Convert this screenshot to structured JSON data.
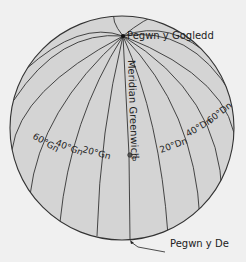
{
  "diagram": {
    "colors": {
      "background": "#f0f0f0",
      "globe_fill": "#d4d4d4",
      "line": "#333333",
      "text": "#222222"
    },
    "labels": {
      "north_pole": "Pegwn y Gogledd",
      "south_pole": "Pegwn y De",
      "prime_meridian": "Meridian Greenwich",
      "origin": "0°",
      "west_60": "60°Gn",
      "west_40": "40°Gn",
      "west_20": "20°Gn",
      "east_20": "20°Dn",
      "east_40": "40°Dn",
      "east_60": "60°Dn"
    }
  }
}
